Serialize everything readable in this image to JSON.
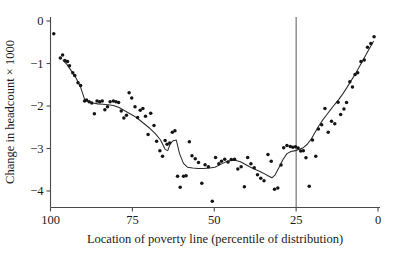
{
  "chart_data": {
    "type": "scatter",
    "title": "",
    "xlabel": "Location of poverty line (percentile of distribution)",
    "ylabel": "Change in headcount × 1000",
    "xlim": [
      100,
      0
    ],
    "ylim": [
      -4.45,
      0.25
    ],
    "x_axis_reversed": true,
    "grid": false,
    "legend": null,
    "xticks": [
      100,
      75,
      50,
      25,
      0
    ],
    "xtick_labels": [
      "100",
      "75",
      "50",
      "25",
      "0"
    ],
    "yticks": [
      0,
      -1,
      -2,
      -3,
      -4
    ],
    "ytick_labels": [
      "0",
      "−1",
      "−2",
      "−3",
      "−4"
    ],
    "annotations": [
      {
        "type": "vertical-line",
        "x": 25,
        "label": ""
      }
    ],
    "series": [
      {
        "name": "observations",
        "type": "scatter",
        "marker": "filled-circle",
        "color": "#141414",
        "points": [
          [
            99.0,
            -0.3
          ],
          [
            97.0,
            -0.87
          ],
          [
            96.3,
            -0.8
          ],
          [
            95.6,
            -0.93
          ],
          [
            94.8,
            -0.95
          ],
          [
            94.2,
            -1.05
          ],
          [
            93.2,
            -1.22
          ],
          [
            92.6,
            -1.28
          ],
          [
            91.6,
            -1.45
          ],
          [
            90.8,
            -1.52
          ],
          [
            89.6,
            -1.88
          ],
          [
            89.0,
            -1.86
          ],
          [
            88.2,
            -1.9
          ],
          [
            87.4,
            -1.93
          ],
          [
            86.6,
            -2.18
          ],
          [
            85.8,
            -1.88
          ],
          [
            85.0,
            -1.9
          ],
          [
            84.2,
            -1.88
          ],
          [
            83.4,
            -2.09
          ],
          [
            82.6,
            -2.02
          ],
          [
            81.8,
            -1.9
          ],
          [
            80.8,
            -1.88
          ],
          [
            80.0,
            -1.9
          ],
          [
            79.2,
            -1.92
          ],
          [
            78.4,
            -2.12
          ],
          [
            77.6,
            -2.28
          ],
          [
            76.8,
            -2.22
          ],
          [
            76.0,
            -1.69
          ],
          [
            75.2,
            -1.81
          ],
          [
            74.2,
            -2.02
          ],
          [
            73.4,
            -2.27
          ],
          [
            72.6,
            -2.1
          ],
          [
            71.8,
            -2.06
          ],
          [
            71.0,
            -2.24
          ],
          [
            70.2,
            -2.67
          ],
          [
            69.4,
            -2.17
          ],
          [
            68.4,
            -2.46
          ],
          [
            67.6,
            -2.83
          ],
          [
            66.6,
            -3.05
          ],
          [
            65.8,
            -3.18
          ],
          [
            65.0,
            -2.81
          ],
          [
            64.4,
            -2.9
          ],
          [
            63.6,
            -2.87
          ],
          [
            62.8,
            -2.62
          ],
          [
            62.0,
            -2.58
          ],
          [
            61.2,
            -3.65
          ],
          [
            60.4,
            -3.91
          ],
          [
            59.4,
            -3.65
          ],
          [
            58.6,
            -3.64
          ],
          [
            57.6,
            -2.84
          ],
          [
            56.8,
            -3.17
          ],
          [
            55.8,
            -3.24
          ],
          [
            54.8,
            -3.33
          ],
          [
            53.8,
            -3.82
          ],
          [
            52.8,
            -3.38
          ],
          [
            51.8,
            -3.43
          ],
          [
            50.6,
            -4.24
          ],
          [
            49.6,
            -3.21
          ],
          [
            48.6,
            -3.36
          ],
          [
            47.8,
            -3.3
          ],
          [
            46.8,
            -3.25
          ],
          [
            45.8,
            -3.32
          ],
          [
            44.8,
            -3.26
          ],
          [
            43.8,
            -3.25
          ],
          [
            42.8,
            -3.48
          ],
          [
            41.8,
            -3.43
          ],
          [
            40.8,
            -3.9
          ],
          [
            39.8,
            -3.21
          ],
          [
            38.8,
            -3.36
          ],
          [
            37.8,
            -3.45
          ],
          [
            36.8,
            -3.62
          ],
          [
            35.8,
            -3.7
          ],
          [
            34.8,
            -3.76
          ],
          [
            33.6,
            -3.14
          ],
          [
            32.6,
            -3.3
          ],
          [
            31.6,
            -3.96
          ],
          [
            30.6,
            -3.93
          ],
          [
            29.6,
            -3.39
          ],
          [
            28.8,
            -2.98
          ],
          [
            27.8,
            -2.93
          ],
          [
            26.8,
            -2.95
          ],
          [
            26.0,
            -2.97
          ],
          [
            25.2,
            -2.96
          ],
          [
            24.4,
            -2.99
          ],
          [
            23.6,
            -3.06
          ],
          [
            22.8,
            -3.05
          ],
          [
            22.0,
            -3.22
          ],
          [
            21.0,
            -3.89
          ],
          [
            20.0,
            -2.8
          ],
          [
            19.0,
            -3.18
          ],
          [
            18.2,
            -2.54
          ],
          [
            17.2,
            -2.44
          ],
          [
            16.2,
            -2.06
          ],
          [
            15.2,
            -2.62
          ],
          [
            14.2,
            -2.36
          ],
          [
            13.2,
            -2.42
          ],
          [
            12.2,
            -1.91
          ],
          [
            11.4,
            -2.2
          ],
          [
            10.4,
            -2.07
          ],
          [
            9.6,
            -1.92
          ],
          [
            8.6,
            -1.43
          ],
          [
            7.8,
            -1.55
          ],
          [
            7.0,
            -1.26
          ],
          [
            6.2,
            -1.22
          ],
          [
            5.2,
            -0.95
          ],
          [
            4.2,
            -0.92
          ],
          [
            3.2,
            -0.62
          ],
          [
            2.2,
            -0.53
          ],
          [
            1.2,
            -0.37
          ]
        ]
      },
      {
        "name": "fitted-curve",
        "type": "line",
        "color": "#2b2b2b",
        "points": [
          [
            96.2,
            -0.92
          ],
          [
            95.0,
            -1.02
          ],
          [
            93.6,
            -1.18
          ],
          [
            92.2,
            -1.34
          ],
          [
            90.8,
            -1.56
          ],
          [
            89.6,
            -1.84
          ],
          [
            88.4,
            -1.9
          ],
          [
            87.0,
            -1.93
          ],
          [
            85.6,
            -1.95
          ],
          [
            84.0,
            -1.96
          ],
          [
            82.4,
            -1.97
          ],
          [
            80.8,
            -1.99
          ],
          [
            79.2,
            -2.03
          ],
          [
            77.6,
            -2.1
          ],
          [
            76.0,
            -2.17
          ],
          [
            74.4,
            -2.24
          ],
          [
            72.8,
            -2.33
          ],
          [
            71.2,
            -2.43
          ],
          [
            69.6,
            -2.53
          ],
          [
            68.0,
            -2.65
          ],
          [
            66.4,
            -2.8
          ],
          [
            65.0,
            -3.02
          ],
          [
            64.2,
            -3.05
          ],
          [
            63.4,
            -2.88
          ],
          [
            62.6,
            -2.82
          ],
          [
            61.6,
            -2.8
          ],
          [
            60.6,
            -3.12
          ],
          [
            59.4,
            -3.35
          ],
          [
            58.2,
            -3.44
          ],
          [
            56.6,
            -3.46
          ],
          [
            55.0,
            -3.47
          ],
          [
            53.2,
            -3.47
          ],
          [
            51.4,
            -3.46
          ],
          [
            49.8,
            -3.44
          ],
          [
            48.2,
            -3.38
          ],
          [
            46.6,
            -3.32
          ],
          [
            45.0,
            -3.28
          ],
          [
            43.4,
            -3.28
          ],
          [
            42.0,
            -3.31
          ],
          [
            40.6,
            -3.37
          ],
          [
            39.2,
            -3.43
          ],
          [
            37.8,
            -3.48
          ],
          [
            36.4,
            -3.53
          ],
          [
            35.0,
            -3.58
          ],
          [
            33.6,
            -3.64
          ],
          [
            32.4,
            -3.69
          ],
          [
            31.4,
            -3.62
          ],
          [
            30.2,
            -3.44
          ],
          [
            29.0,
            -3.26
          ],
          [
            27.8,
            -3.12
          ],
          [
            26.6,
            -3.07
          ],
          [
            25.2,
            -3.05
          ],
          [
            24.0,
            -3.02
          ],
          [
            22.8,
            -2.98
          ],
          [
            21.6,
            -2.9
          ],
          [
            20.4,
            -2.78
          ],
          [
            19.2,
            -2.62
          ],
          [
            18.0,
            -2.46
          ],
          [
            16.8,
            -2.32
          ],
          [
            15.6,
            -2.2
          ],
          [
            14.4,
            -2.08
          ],
          [
            13.2,
            -1.96
          ],
          [
            12.0,
            -1.85
          ],
          [
            10.8,
            -1.72
          ],
          [
            9.6,
            -1.58
          ],
          [
            8.4,
            -1.43
          ],
          [
            7.2,
            -1.28
          ],
          [
            6.0,
            -1.12
          ],
          [
            4.8,
            -0.95
          ],
          [
            3.6,
            -0.78
          ],
          [
            2.4,
            -0.62
          ],
          [
            1.4,
            -0.48
          ]
        ]
      }
    ]
  }
}
